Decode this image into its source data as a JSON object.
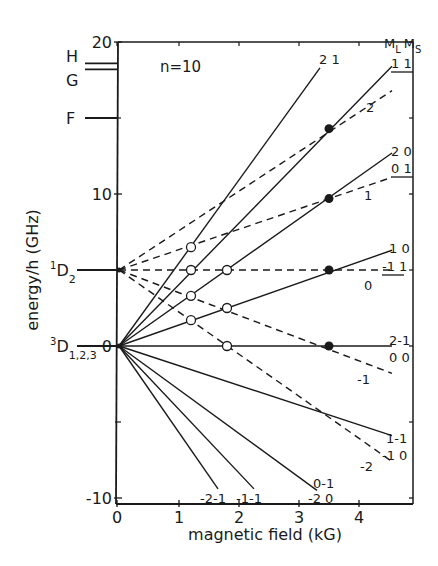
{
  "chart_data": {
    "type": "line",
    "title": "n=10",
    "xlabel": "magnetic field (kG)",
    "ylabel": "energy/h (GHz)",
    "xlim": [
      0,
      4.9
    ],
    "ylim": [
      -10,
      20
    ],
    "xticks": [
      0,
      1,
      2,
      3,
      4
    ],
    "yticks": [
      -10,
      0,
      10,
      20
    ],
    "xtick_labels": [
      "0",
      "1",
      "2",
      "3",
      "4"
    ],
    "ytick_labels": [
      "-10",
      "0",
      "10",
      "20"
    ],
    "grid": false,
    "legend_header": {
      "ml": "M",
      "ml_sub": "L",
      "ms": "M",
      "ms_sub": "S"
    },
    "levels": [
      {
        "name": "H",
        "energy": 18.6
      },
      {
        "name": "G",
        "energy": 18.2
      },
      {
        "name": "F",
        "energy": 15.0
      }
    ],
    "states": [
      {
        "label": "1D2",
        "main": "D",
        "sup": "1",
        "sub": "2",
        "energy": 5.0
      },
      {
        "label": "3D1,2,3",
        "main": "D",
        "sup": "3",
        "sub": "1,2,3",
        "energy": 0.0
      }
    ],
    "series": [
      {
        "name": "2 1",
        "style": "solid",
        "origin": 0,
        "x": [
          0,
          3.35
        ],
        "y": [
          0,
          18.3
        ],
        "labels": [
          "2 1"
        ],
        "underline": false
      },
      {
        "name": "1 1",
        "style": "solid",
        "origin": 0,
        "x": [
          0,
          4.55
        ],
        "y": [
          0,
          18.4
        ],
        "labels": [
          "1 1"
        ],
        "underline": true
      },
      {
        "name": "2 0 / 0 1",
        "style": "solid",
        "origin": 0,
        "x": [
          0,
          4.55
        ],
        "y": [
          0,
          12.7
        ],
        "labels": [
          "2 0",
          "0 1"
        ],
        "underline": true
      },
      {
        "name": "1 0 / -1 1",
        "style": "solid",
        "origin": 0,
        "x": [
          0,
          4.55
        ],
        "y": [
          0,
          6.3
        ],
        "labels": [
          "1 0",
          "-1 1"
        ],
        "underline": true
      },
      {
        "name": "2-1 / 0 0",
        "style": "solid",
        "origin": 0,
        "x": [
          0,
          4.55
        ],
        "y": [
          0,
          0
        ],
        "labels": [
          "2-1",
          "0 0"
        ],
        "underline": false
      },
      {
        "name": "1-1 / -1 0",
        "style": "solid",
        "origin": 0,
        "x": [
          0,
          4.55
        ],
        "y": [
          0,
          -5.9
        ],
        "labels": [
          "1-1",
          "-1 0"
        ],
        "underline": false
      },
      {
        "name": "0-1 / -2 0",
        "style": "solid",
        "origin": 0,
        "x": [
          0,
          3.3
        ],
        "y": [
          0,
          -9.5
        ],
        "labels": [
          "0-1",
          "-2 0"
        ],
        "underline": false
      },
      {
        "name": "-1-1",
        "style": "solid",
        "origin": 0,
        "x": [
          0,
          2.25
        ],
        "y": [
          0,
          -9.4
        ],
        "labels": [
          "-1-1"
        ],
        "underline": false
      },
      {
        "name": "-2-1",
        "style": "solid",
        "origin": 0,
        "x": [
          0,
          1.65
        ],
        "y": [
          0,
          -9.4
        ],
        "labels": [
          "-2-1"
        ],
        "underline": false
      },
      {
        "name": "2",
        "style": "dashed",
        "origin": 5,
        "x": [
          0,
          4.55
        ],
        "y": [
          5,
          16.8
        ],
        "labels": [
          "2"
        ]
      },
      {
        "name": "1",
        "style": "dashed",
        "origin": 5,
        "x": [
          0,
          4.55
        ],
        "y": [
          5,
          11.1
        ],
        "labels": [
          "1"
        ]
      },
      {
        "name": "0",
        "style": "dashed",
        "origin": 5,
        "x": [
          0,
          4.55
        ],
        "y": [
          5,
          5
        ],
        "labels": [
          "0"
        ]
      },
      {
        "name": "-1",
        "style": "dashed",
        "origin": 5,
        "x": [
          0,
          4.55
        ],
        "y": [
          5,
          -1.8
        ],
        "labels": [
          "-1"
        ]
      },
      {
        "name": "-2",
        "style": "dashed",
        "origin": 5,
        "x": [
          0,
          4.55
        ],
        "y": [
          5,
          -7.6
        ],
        "labels": [
          "-2"
        ]
      }
    ],
    "filled_crossings": [
      {
        "x": 3.5,
        "y": 14.3
      },
      {
        "x": 3.5,
        "y": 9.7
      },
      {
        "x": 3.5,
        "y": 5.0
      },
      {
        "x": 3.5,
        "y": 0.0
      }
    ],
    "open_crossings": [
      {
        "x": 1.2,
        "y": 6.5
      },
      {
        "x": 1.2,
        "y": 5.0
      },
      {
        "x": 1.2,
        "y": 3.3
      },
      {
        "x": 1.2,
        "y": 1.7
      },
      {
        "x": 1.8,
        "y": 5.0
      },
      {
        "x": 1.8,
        "y": 2.5
      },
      {
        "x": 1.8,
        "y": 0.0
      }
    ]
  }
}
